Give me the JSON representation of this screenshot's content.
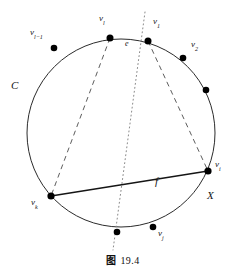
{
  "figure": {
    "caption_prefix": "图",
    "caption_number": "19.4",
    "caption_full": "图 19.4",
    "curve_label": "C",
    "region_label": "X",
    "edge_e_label": "e",
    "edge_f_label": "f"
  },
  "geometry": {
    "circle": {
      "cx": 121,
      "cy": 133,
      "r": 94,
      "stroke": "#2b2b2b",
      "stroke_width": 1
    },
    "colors": {
      "ink": "#1a1a1a",
      "stroke": "#2b2b2b",
      "dot": "#000000",
      "background": "#ffffff"
    }
  },
  "vertices": [
    {
      "id": "v_l_minus_1",
      "base": "v",
      "sub": "l−1",
      "label": "v",
      "sublabel": "l−1",
      "x": 54,
      "y": 48,
      "label_x": 30,
      "label_y": 33,
      "labeled": true
    },
    {
      "id": "v_l",
      "base": "v",
      "sub": "l",
      "label": "v",
      "sublabel": "l",
      "x": 110,
      "y": 38,
      "label_x": 99,
      "label_y": 19,
      "labeled": true
    },
    {
      "id": "v_1",
      "base": "v",
      "sub": "1",
      "label": "v",
      "sublabel": "1",
      "x": 148,
      "y": 41,
      "label_x": 152,
      "label_y": 22,
      "labeled": true
    },
    {
      "id": "v_2",
      "base": "v",
      "sub": "2",
      "label": "v",
      "sublabel": "2",
      "x": 183,
      "y": 58,
      "label_x": 190,
      "label_y": 46,
      "labeled": true
    },
    {
      "id": "v_unlabeled_right",
      "base": "",
      "sub": "",
      "label": "",
      "sublabel": "",
      "x": 206,
      "y": 90,
      "label_x": 0,
      "label_y": 0,
      "labeled": false
    },
    {
      "id": "v_i",
      "base": "v",
      "sub": "i",
      "label": "v",
      "sublabel": "i",
      "x": 208,
      "y": 171,
      "label_x": 216,
      "label_y": 165,
      "labeled": true
    },
    {
      "id": "v_j",
      "base": "v",
      "sub": "j",
      "label": "v",
      "sublabel": "j",
      "x": 153,
      "y": 227,
      "label_x": 158,
      "label_y": 233,
      "labeled": true
    },
    {
      "id": "v_unlabeled_bottom",
      "base": "",
      "sub": "",
      "label": "",
      "sublabel": "",
      "x": 117,
      "y": 232,
      "label_x": 0,
      "label_y": 0,
      "labeled": false
    },
    {
      "id": "v_k",
      "base": "v",
      "sub": "k",
      "label": "v",
      "sublabel": "k",
      "x": 51,
      "y": 196,
      "label_x": 33,
      "label_y": 200,
      "labeled": true
    }
  ],
  "edges": {
    "chord_f": {
      "from": "v_k",
      "to": "v_i",
      "style": "solid",
      "label": "f",
      "label_x": 156,
      "label_y": 183
    },
    "dashed_left": {
      "from": "v_l",
      "to": "v_k",
      "style": "dashed"
    },
    "dashed_right": {
      "from": "v_1",
      "to": "v_i",
      "style": "dashed"
    },
    "dotted_cut": {
      "style": "dotted",
      "x1": 145,
      "y1": 12,
      "x2": 113,
      "y2": 250
    }
  },
  "labels": {
    "C": {
      "text": "C",
      "x": 12,
      "y": 86
    },
    "X": {
      "text": "X",
      "x": 208,
      "y": 196
    },
    "e": {
      "text": "e",
      "x": 126,
      "y": 44
    },
    "f": {
      "text": "f",
      "x": 156,
      "y": 181
    }
  }
}
